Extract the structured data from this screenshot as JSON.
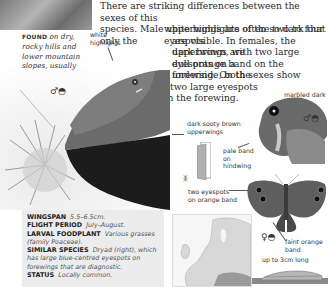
{
  "intro": {
    "lines": [
      "There are striking differences between the sexes of this",
      "species. Male upperwings are often so dark that only the",
      "white highlights of the two to four eyespots",
      "are visible. In females, the upperwings are",
      "dark brown, with two large eyespots on a",
      "dull orange band on the forewing. On the",
      "underside, both sexes show",
      "two large eyespots",
      "on the forewing."
    ]
  },
  "found": {
    "label": "FOUND",
    "text": "on dry, rocky hills and lower mountain slopes, usually between 500m and 1,500m."
  },
  "labels": {
    "white_highlights": "white highlights",
    "marbled_dark_brown": "marbled dark brown",
    "dark_sooty_brown_upperwings": "dark sooty brown upperwings",
    "pale_band_on_hindwing": "pale band on hindwing",
    "two_eyespots_on_orange_band": "two eyespots on orange band",
    "faint_orange_band": "faint orange band",
    "caterpillar_length": "up to 3cm long"
  },
  "symbols": {
    "male_underside": "♂◓",
    "male_photo": "♂◓",
    "female_upperside": "♀◓"
  },
  "specs": [
    {
      "key": "WINGSPAN",
      "value": "5.5–6.5cm."
    },
    {
      "key": "FLIGHT PERIOD",
      "value": "July–August."
    },
    {
      "key": "LARVAL FOODPLANT",
      "value": "Various grasses (family Poaceae)."
    },
    {
      "key": "SIMILAR SPECIES",
      "value": "Dryad (right), which has large blue-centred eyespots on forewings that are diagnostic."
    },
    {
      "key": "STATUS",
      "value": "Locally common."
    }
  ],
  "icons": {
    "butterfly_small": "butterfly-icon"
  }
}
